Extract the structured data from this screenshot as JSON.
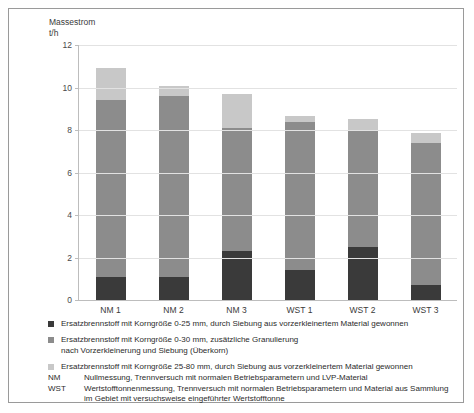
{
  "axis_title": "Massestrom\nt/h",
  "chart_data": {
    "type": "bar",
    "stacked": true,
    "title": "",
    "subtitle": "",
    "xlabel": "",
    "ylabel": "Massestrom t/h",
    "ylim": [
      0,
      12
    ],
    "yticks": [
      0,
      2,
      4,
      6,
      8,
      10,
      12
    ],
    "ytick_labels": [
      "0",
      "2",
      "4",
      "6",
      "8",
      "10",
      "12"
    ],
    "grid": true,
    "legend_position": "below",
    "categories": [
      "NM 1",
      "NM 2",
      "NM 3",
      "WST 1",
      "WST 2",
      "WST 3"
    ],
    "series": [
      {
        "name": "Ersatzbrennstoff mit Korngröße 0-25 mm, durch Siebung aus vorzerkleinertem Material gewonnen",
        "color": "#3a3a3a",
        "values": [
          1.1,
          1.1,
          2.3,
          1.4,
          2.5,
          0.7
        ]
      },
      {
        "name": "Ersatzbrennstoff mit Korngröße 0-30 mm, zusätzliche Granulierung nach Vorzerkleinerung und Siebung (Überkorn)",
        "color": "#8c8c8c",
        "values": [
          8.3,
          8.5,
          5.8,
          7.0,
          5.5,
          6.7
        ]
      },
      {
        "name": "Ersatzbrennstoff mit Korngröße 25-80 mm, durch Siebung aus vorzerkleinertem Material gewonnen",
        "color": "#c8c8c8",
        "values": [
          1.5,
          0.45,
          1.6,
          0.25,
          0.5,
          0.45
        ]
      }
    ],
    "totals": [
      10.9,
      10.05,
      9.7,
      8.65,
      8.5,
      7.85
    ]
  },
  "legend": {
    "items": [
      {
        "swatch_color": "#3a3a3a",
        "label": "Ersatzbrennstoff mit Korngröße 0-25 mm, durch Siebung aus vorzerkleinertem Material gewonnen"
      },
      {
        "swatch_color": "#8c8c8c",
        "label": "Ersatzbrennstoff mit Korngröße 0-30 mm, zusätzliche Granulierung\nnach Vorzerkleinerung und Siebung (Überkorn)"
      },
      {
        "swatch_color": "#c8c8c8",
        "label": "Ersatzbrennstoff mit Korngröße 25-80 mm, durch Siebung aus vorzerkleinertem Material gewonnen"
      }
    ]
  },
  "notes": [
    {
      "key": "NM",
      "text": "Nullmessung, Trennversuch mit normalen Betriebsparametern und LVP-Material"
    },
    {
      "key": "WST",
      "text": "Wertstofftonnenmessung, Trennversuch mit normalen Betriebsparametern und Material aus Sammlung\nim Gebiet mit versuchsweise eingeführter Wertstofftonne"
    }
  ]
}
